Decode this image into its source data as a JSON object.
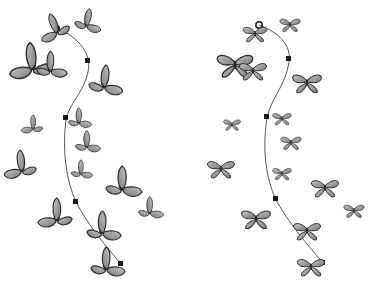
{
  "illustration": {
    "title": "Butterflies distributed along a spine path",
    "colors": {
      "background": "#ffffff",
      "wing_fill": "#8a8a8a",
      "wing_light": "#b8b8b8",
      "wing_outline": "#2a2a2a",
      "path_stroke": "#555555",
      "node_fill": "#1a1a1a"
    },
    "panels": [
      {
        "name": "left-panel",
        "style": "side-view",
        "path_nodes": 4,
        "butterfly_count": 19
      },
      {
        "name": "right-panel",
        "style": "top-view",
        "path_nodes": 4,
        "butterfly_count": 18
      }
    ]
  }
}
